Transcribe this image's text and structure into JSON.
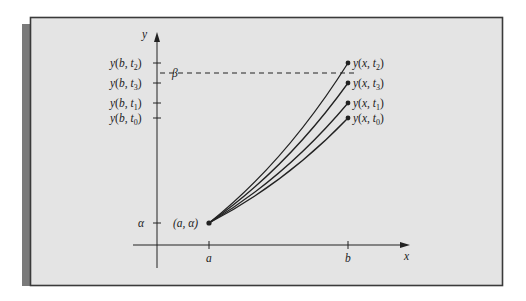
{
  "diagram": {
    "axes": {
      "x_label": "x",
      "y_label": "y",
      "x_ticks": [
        {
          "id": "a",
          "label": "a"
        },
        {
          "id": "b",
          "label": "b"
        }
      ]
    },
    "y_tick_labels": [
      {
        "id": "t2",
        "fn": "y(b, ",
        "var": "t",
        "sub": "2",
        "close": ")"
      },
      {
        "id": "t3",
        "fn": "y(b, ",
        "var": "t",
        "sub": "3",
        "close": ")"
      },
      {
        "id": "t1",
        "fn": "y(b, ",
        "var": "t",
        "sub": "1",
        "close": ")"
      },
      {
        "id": "t0",
        "fn": "y(b, ",
        "var": "t",
        "sub": "0",
        "close": ")"
      }
    ],
    "alpha_label": "α",
    "beta_label": "β",
    "start_point_label": "(a, α)",
    "curves": [
      {
        "id": "t2",
        "label_fn": "y(x, ",
        "var": "t",
        "sub": "2",
        "close": ")",
        "rank": 1
      },
      {
        "id": "t3",
        "label_fn": "y(x, ",
        "var": "t",
        "sub": "3",
        "close": ")",
        "rank": 2
      },
      {
        "id": "t1",
        "label_fn": "y(x, ",
        "var": "t",
        "sub": "1",
        "close": ")",
        "rank": 3
      },
      {
        "id": "t0",
        "label_fn": "y(x, ",
        "var": "t",
        "sub": "0",
        "close": ")",
        "rank": 4
      }
    ],
    "colors": {
      "panel_bg": "#e4e4e4",
      "frame": "#3a3a3a",
      "shadow": "#7a7a7a",
      "ink": "#222222"
    }
  }
}
